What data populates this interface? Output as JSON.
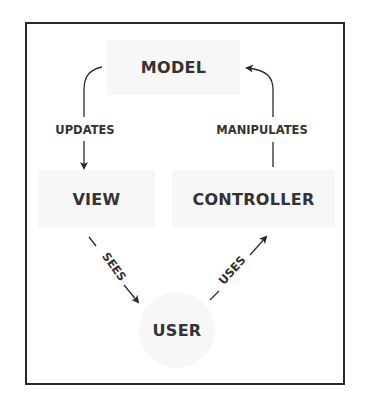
{
  "diagram": {
    "nodes": {
      "model": {
        "label": "MODEL"
      },
      "view": {
        "label": "VIEW"
      },
      "controller": {
        "label": "CONTROLLER"
      },
      "user": {
        "label": "USER"
      }
    },
    "edges": {
      "updates": {
        "label": "UPDATES",
        "from": "MODEL",
        "to": "VIEW"
      },
      "manipulates": {
        "label": "MANIPULATES",
        "from": "CONTROLLER",
        "to": "MODEL"
      },
      "sees": {
        "label": "SEES",
        "from": "VIEW",
        "to": "USER"
      },
      "uses": {
        "label": "USES",
        "from": "USER",
        "to": "CONTROLLER"
      }
    },
    "colors": {
      "border": "#2a2a2a",
      "node_fill": "#f7f7f7",
      "text": "#333333"
    }
  }
}
